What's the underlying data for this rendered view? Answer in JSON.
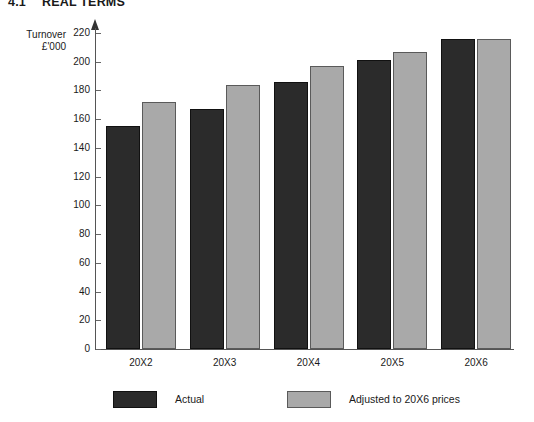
{
  "title": {
    "number": "4.1",
    "text": "REAL TERMS"
  },
  "axis_title": {
    "line1": "Turnover",
    "line2": "£'000"
  },
  "legend": {
    "items": [
      {
        "label": "Actual",
        "color": "#2b2b2b",
        "swatch": "actual-swatch"
      },
      {
        "label": "Adjusted to 20X6 prices",
        "color": "#a9a9a9",
        "swatch": "adjusted-swatch"
      }
    ]
  },
  "chart_data": {
    "type": "bar",
    "xlabel": "",
    "ylabel": "Turnover £'000",
    "ylim": [
      0,
      220
    ],
    "yticks": [
      0,
      20,
      40,
      60,
      80,
      100,
      120,
      140,
      160,
      180,
      200,
      220
    ],
    "ytick_labels": [
      "0",
      "20",
      "40",
      "60",
      "80",
      "100",
      "120",
      "140",
      "160",
      "180",
      "200",
      "220"
    ],
    "grid": false,
    "legend_position": "bottom",
    "categories": [
      "20X2",
      "20X3",
      "20X4",
      "20X5",
      "20X6"
    ],
    "series": [
      {
        "name": "Actual",
        "color": "#2b2b2b",
        "values": [
          155,
          167,
          186,
          201,
          216
        ]
      },
      {
        "name": "Adjusted to 20X6 prices",
        "color": "#a9a9a9",
        "values": [
          172,
          184,
          197,
          207,
          216
        ]
      }
    ]
  }
}
